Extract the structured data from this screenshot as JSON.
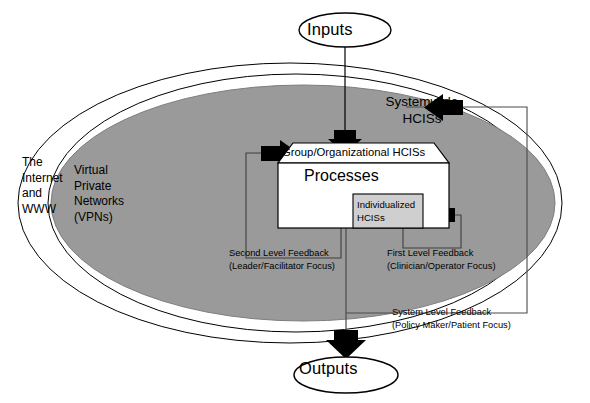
{
  "diagram": {
    "colors": {
      "ellipse_fill": "#9a9a9a",
      "box_fill": "#ffffff",
      "inner_box_fill": "#cfcfcf",
      "stroke": "#000000",
      "page_background": "#ffffff"
    },
    "flow": {
      "input_label": "Inputs",
      "output_label": "Outputs"
    },
    "environment_rings": [
      {
        "id": "internet",
        "label": "The\nInternet\nand\nWWW"
      },
      {
        "id": "vpn",
        "label": "Virtual\nPrivate\nNetworks\n(VPNs)"
      }
    ],
    "system_scope": {
      "label": "Systemwide\nHCISs"
    },
    "core": {
      "banner_label": "Group/Organizational HCISs",
      "process_label": "Processes",
      "inner_label": "Individualized\nHCISs"
    },
    "feedback_loops": [
      {
        "id": "second-level",
        "label": "Second Level Feedback\n(Leader/Facilitator Focus)",
        "title": "Second Level Feedback",
        "focus": "(Leader/Facilitator Focus)"
      },
      {
        "id": "first-level",
        "label": "First Level Feedback\n(Clinician/Operator Focus)",
        "title": "First Level Feedback",
        "focus": "(Clinician/Operator Focus)"
      },
      {
        "id": "system-level",
        "label": "System Level Feedback\n(Policy Maker/Patient Focus)",
        "title": "System Level Feedback",
        "focus": "(Policy Maker/Patient Focus)"
      }
    ],
    "icons": {
      "input_arrow": "arrow-down-icon",
      "output_arrow": "arrow-down-icon",
      "systemwide_arrow": "arrow-left-icon",
      "second_level_arrow": "arrow-right-icon",
      "first_level_arrow": "arrow-left-icon"
    }
  }
}
